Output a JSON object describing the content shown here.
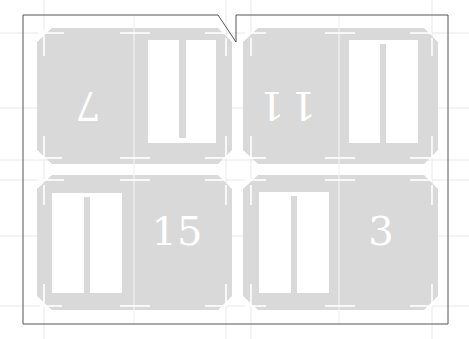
{
  "diagram": {
    "type": "die-cut sheet layout",
    "colors": {
      "card_fill": "#d9d9d9",
      "slot_fill": "#ffffff",
      "outline": "#555555",
      "guide": "#e6e6e6",
      "number": "#ffffff"
    },
    "cards": [
      {
        "position": "top-left",
        "number": "7",
        "number_rotated": true,
        "slot_side": "right"
      },
      {
        "position": "top-right",
        "number": "11",
        "number_rotated": true,
        "slot_side": "right"
      },
      {
        "position": "bottom-left",
        "number": "15",
        "number_rotated": false,
        "slot_side": "left"
      },
      {
        "position": "bottom-right",
        "number": "3",
        "number_rotated": false,
        "slot_side": "left"
      }
    ]
  }
}
